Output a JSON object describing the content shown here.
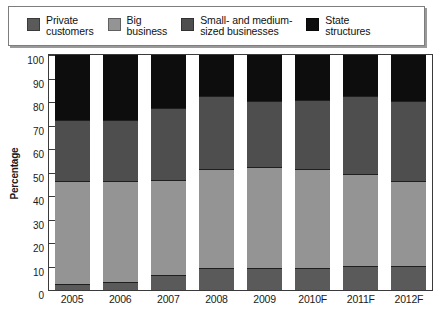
{
  "legend": {
    "items": [
      {
        "label": "Private\ncustomers",
        "color": "#5a5a5a",
        "icon": "legend-swatch-icon"
      },
      {
        "label": "Big\nbusiness",
        "color": "#949494",
        "icon": "legend-swatch-icon"
      },
      {
        "label": "Small- and medium-\nsized businesses",
        "color": "#4e4e4e",
        "icon": "legend-swatch-icon"
      },
      {
        "label": "State\nstructures",
        "color": "#0d0d0d",
        "icon": "legend-swatch-icon"
      }
    ]
  },
  "chart_data": {
    "type": "bar",
    "stacked": true,
    "title": "",
    "subtitle": "",
    "xlabel": "",
    "ylabel": "Percentage",
    "ylim": [
      0,
      100
    ],
    "yticks": [
      100,
      90,
      80,
      70,
      60,
      50,
      40,
      30,
      20,
      10,
      0
    ],
    "ytick_labels": [
      "100",
      "90",
      "80",
      "70",
      "60",
      "50",
      "40",
      "30",
      "20",
      "10",
      "0"
    ],
    "grid": false,
    "legend_position": "top",
    "categories": [
      "2005",
      "2006",
      "2007",
      "2008",
      "2009",
      "2010F",
      "2011F",
      "2012F"
    ],
    "series": [
      {
        "name": "Private customers",
        "color": "#5a5a5a",
        "values": [
          2,
          3,
          6,
          9,
          9,
          9,
          10,
          10
        ]
      },
      {
        "name": "Big business",
        "color": "#949494",
        "values": [
          44,
          43,
          40.5,
          42,
          43,
          42,
          39,
          36
        ]
      },
      {
        "name": "Small- and medium-sized businesses",
        "color": "#4e4e4e",
        "values": [
          26,
          26,
          30.5,
          31,
          28,
          29.5,
          33,
          34
        ]
      },
      {
        "name": "State structures",
        "color": "#0d0d0d",
        "values": [
          28,
          28,
          23,
          18,
          20,
          19.5,
          18,
          20
        ]
      }
    ],
    "cumulative_tops": {
      "private_customers": [
        2,
        3,
        6,
        9,
        9,
        9,
        10,
        10
      ],
      "big_business": [
        46,
        46,
        46.5,
        51,
        52,
        51,
        49,
        46
      ],
      "sme": [
        72,
        72,
        77,
        82,
        80,
        80.5,
        82,
        80
      ],
      "state_structures": [
        100,
        100,
        100,
        100,
        100,
        100,
        100,
        100
      ]
    }
  }
}
